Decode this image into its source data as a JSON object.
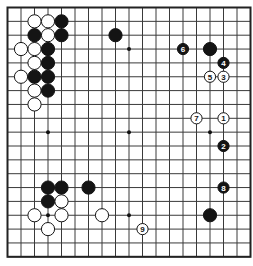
{
  "board": {
    "size": 19,
    "origin_x": 7.5,
    "origin_y": 7.5,
    "step_x": 13.5,
    "step_y": 13.85,
    "line_color": "#3a3a3a",
    "border_color": "#222222",
    "background": "#ffffff",
    "star_points": [
      [
        3,
        3
      ],
      [
        9,
        3
      ],
      [
        15,
        3
      ],
      [
        3,
        9
      ],
      [
        9,
        9
      ],
      [
        15,
        9
      ],
      [
        3,
        15
      ],
      [
        9,
        15
      ],
      [
        15,
        15
      ]
    ]
  },
  "stones": [
    {
      "color": "white",
      "col": 2,
      "row": 1
    },
    {
      "color": "white",
      "col": 3,
      "row": 1
    },
    {
      "color": "black",
      "col": 4,
      "row": 1
    },
    {
      "color": "black",
      "col": 2,
      "row": 2
    },
    {
      "color": "white",
      "col": 3,
      "row": 2
    },
    {
      "color": "black",
      "col": 4,
      "row": 2
    },
    {
      "color": "white",
      "col": 1,
      "row": 3
    },
    {
      "color": "white",
      "col": 2,
      "row": 3
    },
    {
      "color": "black",
      "col": 3,
      "row": 3
    },
    {
      "color": "white",
      "col": 2,
      "row": 4
    },
    {
      "color": "black",
      "col": 3,
      "row": 4
    },
    {
      "color": "white",
      "col": 1,
      "row": 5
    },
    {
      "color": "black",
      "col": 2,
      "row": 5
    },
    {
      "color": "black",
      "col": 3,
      "row": 5
    },
    {
      "color": "white",
      "col": 2,
      "row": 6
    },
    {
      "color": "black",
      "col": 3,
      "row": 6
    },
    {
      "color": "white",
      "col": 2,
      "row": 7
    },
    {
      "color": "black",
      "col": 8,
      "row": 2
    },
    {
      "color": "black",
      "col": 15,
      "row": 3
    },
    {
      "color": "black",
      "col": 3,
      "row": 13
    },
    {
      "color": "black",
      "col": 4,
      "row": 13
    },
    {
      "color": "black",
      "col": 6,
      "row": 13
    },
    {
      "color": "black",
      "col": 3,
      "row": 14
    },
    {
      "color": "white",
      "col": 4,
      "row": 14
    },
    {
      "color": "white",
      "col": 2,
      "row": 15
    },
    {
      "color": "white",
      "col": 4,
      "row": 15
    },
    {
      "color": "white",
      "col": 7,
      "row": 15
    },
    {
      "color": "white",
      "col": 3,
      "row": 16
    },
    {
      "color": "black",
      "col": 15,
      "row": 15
    }
  ],
  "numbered_moves": [
    {
      "label": "1",
      "color": "white",
      "col": 16,
      "row": 8
    },
    {
      "label": "2",
      "color": "black",
      "col": 16,
      "row": 10
    },
    {
      "label": "3",
      "color": "white",
      "col": 16,
      "row": 5
    },
    {
      "label": "4",
      "color": "black",
      "col": 16,
      "row": 4
    },
    {
      "label": "5",
      "color": "white",
      "col": 15,
      "row": 5
    },
    {
      "label": "6",
      "color": "black",
      "col": 13,
      "row": 3
    },
    {
      "label": "7",
      "color": "white",
      "col": 14,
      "row": 8
    },
    {
      "label": "8",
      "color": "black",
      "col": 16,
      "row": 13
    },
    {
      "label": "9",
      "color": "white",
      "col": 10,
      "row": 16
    }
  ]
}
